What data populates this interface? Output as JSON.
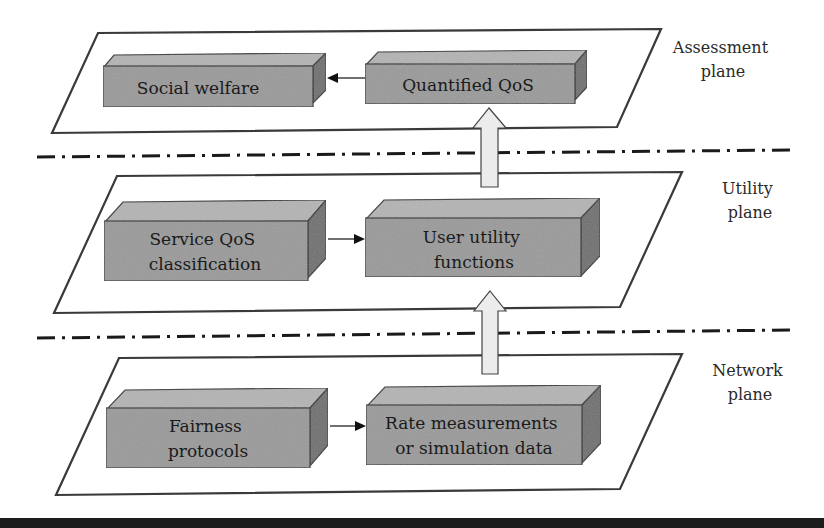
{
  "diagram": {
    "planes": [
      {
        "id": "assessment",
        "label_line1": "Assessment",
        "label_line2": "plane",
        "boxes": [
          {
            "line1": "Social welfare",
            "line2": ""
          },
          {
            "line1": "Quantified QoS",
            "line2": ""
          }
        ],
        "flow": "right-to-left"
      },
      {
        "id": "utility",
        "label_line1": "Utility",
        "label_line2": "plane",
        "boxes": [
          {
            "line1": "Service QoS",
            "line2": "classification"
          },
          {
            "line1": "User utility",
            "line2": "functions"
          }
        ],
        "flow": "left-to-right"
      },
      {
        "id": "network",
        "label_line1": "Network",
        "label_line2": "plane",
        "boxes": [
          {
            "line1": "Fairness",
            "line2": "protocols"
          },
          {
            "line1": "Rate measurements",
            "line2": "or simulation data"
          }
        ],
        "flow": "left-to-right"
      }
    ],
    "inter_plane_arrows": [
      {
        "from": "network",
        "to": "utility"
      },
      {
        "from": "utility",
        "to": "assessment"
      }
    ],
    "colors": {
      "box_front": "#9a9a9a",
      "box_top": "#b4b4b4",
      "box_side": "#6e6e6e",
      "plane_border": "#3a3a3a",
      "up_arrow_fill": "#ececec",
      "divider": "#1a1a1a"
    }
  }
}
